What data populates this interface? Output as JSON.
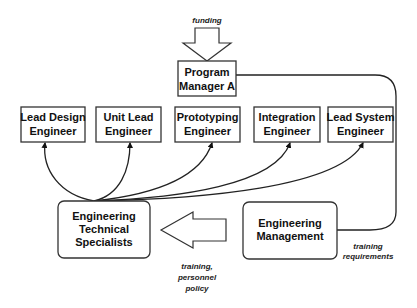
{
  "diagram": {
    "top_label": "funding",
    "program_manager": {
      "line1": "Program",
      "line2": "Manager A"
    },
    "engineers": [
      {
        "line1": "Lead Design",
        "line2": "Engineer"
      },
      {
        "line1": "Unit Lead",
        "line2": "Engineer"
      },
      {
        "line1": "Prototyping",
        "line2": "Engineer"
      },
      {
        "line1": "Integration",
        "line2": "Engineer"
      },
      {
        "line1": "Lead System",
        "line2": "Engineer"
      }
    ],
    "specialists": {
      "line1": "Engineering",
      "line2": "Technical",
      "line3": "Specialists"
    },
    "management": {
      "line1": "Engineering",
      "line2": "Management"
    },
    "arrow_label": {
      "line1": "training,",
      "line2": "personnel",
      "line3": "policy"
    },
    "loop_label": {
      "line1": "training",
      "line2": "requirements"
    }
  }
}
